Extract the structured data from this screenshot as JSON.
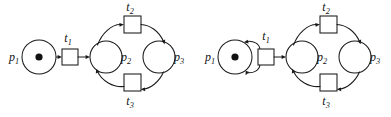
{
  "figure": {
    "background_color": "#ffffff",
    "ink_color": "#1a1a1a",
    "token_color": "#111111"
  },
  "diagrams": [
    {
      "id": "left-net",
      "name": "petri-net-left",
      "variant": "straight-arc",
      "origin_x": 0,
      "places": [
        {
          "id": "p1",
          "label": "p",
          "subscript": "1",
          "cx": 39,
          "cy": 57,
          "r": 17,
          "tokens": 1,
          "label_x": 14,
          "label_y": 61,
          "label_pos": "left"
        },
        {
          "id": "p2",
          "label": "p",
          "subscript": "2",
          "cx": 106,
          "cy": 57,
          "r": 16,
          "tokens": 0,
          "label_x": 126,
          "label_y": 61,
          "label_pos": "right"
        },
        {
          "id": "p3",
          "label": "p",
          "subscript": "3",
          "cx": 159,
          "cy": 57,
          "r": 16,
          "tokens": 0,
          "label_x": 179,
          "label_y": 61,
          "label_pos": "right"
        }
      ],
      "transitions": [
        {
          "id": "t1",
          "label": "t",
          "subscript": "1",
          "x": 62,
          "y": 49,
          "w": 16,
          "h": 16,
          "label_x": 66,
          "label_y": 42,
          "label_pos": "above"
        },
        {
          "id": "t2",
          "label": "t",
          "subscript": "2",
          "x": 124,
          "y": 16,
          "w": 17,
          "h": 17,
          "label_x": 128,
          "label_y": 11,
          "label_pos": "above"
        },
        {
          "id": "t3",
          "label": "t",
          "subscript": "3",
          "x": 124,
          "y": 74,
          "w": 17,
          "h": 17,
          "label_x": 128,
          "label_y": 104,
          "label_pos": "below"
        }
      ],
      "arcs": [
        {
          "from": "p1",
          "to": "t1",
          "style": "straight"
        },
        {
          "from": "t1",
          "to": "p2",
          "style": "straight"
        },
        {
          "from": "p2",
          "to": "t2",
          "style": "curved"
        },
        {
          "from": "t2",
          "to": "p3",
          "style": "curved"
        },
        {
          "from": "p3",
          "to": "t3",
          "style": "curved"
        },
        {
          "from": "t3",
          "to": "p2",
          "style": "curved"
        }
      ]
    },
    {
      "id": "right-net",
      "name": "petri-net-right",
      "variant": "bidirectional-curved-arc",
      "origin_x": 196,
      "places": [
        {
          "id": "p1",
          "label": "p",
          "subscript": "1",
          "cx": 39,
          "cy": 57,
          "r": 17,
          "tokens": 1,
          "label_x": 14,
          "label_y": 61,
          "label_pos": "left"
        },
        {
          "id": "p2",
          "label": "p",
          "subscript": "2",
          "cx": 106,
          "cy": 57,
          "r": 16,
          "tokens": 0,
          "label_x": 126,
          "label_y": 61,
          "label_pos": "right"
        },
        {
          "id": "p3",
          "label": "p",
          "subscript": "3",
          "cx": 159,
          "cy": 57,
          "r": 16,
          "tokens": 0,
          "label_x": 179,
          "label_y": 61,
          "label_pos": "right"
        }
      ],
      "transitions": [
        {
          "id": "t1",
          "label": "t",
          "subscript": "1",
          "x": 62,
          "y": 49,
          "w": 16,
          "h": 16,
          "label_x": 67,
          "label_y": 40,
          "label_pos": "above"
        },
        {
          "id": "t2",
          "label": "t",
          "subscript": "2",
          "x": 124,
          "y": 16,
          "w": 17,
          "h": 17,
          "label_x": 128,
          "label_y": 11,
          "label_pos": "above"
        },
        {
          "id": "t3",
          "label": "t",
          "subscript": "3",
          "x": 124,
          "y": 74,
          "w": 17,
          "h": 17,
          "label_x": 128,
          "label_y": 104,
          "label_pos": "below"
        }
      ],
      "arcs": [
        {
          "from": "p1",
          "to": "t1",
          "style": "curved-lower"
        },
        {
          "from": "t1",
          "to": "p1",
          "style": "curved-upper"
        },
        {
          "from": "t1",
          "to": "p2",
          "style": "straight"
        },
        {
          "from": "p2",
          "to": "t2",
          "style": "curved"
        },
        {
          "from": "t2",
          "to": "p3",
          "style": "curved"
        },
        {
          "from": "p3",
          "to": "t3",
          "style": "curved"
        },
        {
          "from": "t3",
          "to": "p2",
          "style": "curved"
        }
      ]
    }
  ]
}
